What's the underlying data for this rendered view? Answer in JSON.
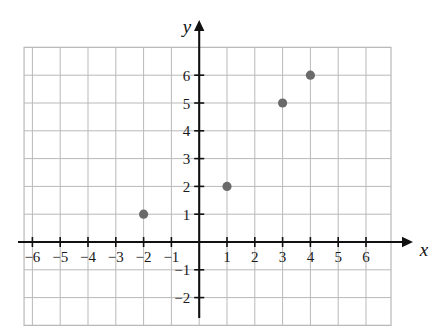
{
  "chart_data": {
    "type": "scatter",
    "title": "",
    "xlabel": "x",
    "ylabel": "y",
    "points": [
      {
        "x": -2,
        "y": 1
      },
      {
        "x": 1,
        "y": 2
      },
      {
        "x": 3,
        "y": 5
      },
      {
        "x": 4,
        "y": 6
      }
    ],
    "x": [
      -2,
      1,
      3,
      4
    ],
    "values": [
      1,
      2,
      5,
      6
    ],
    "xlim": [
      -6.3,
      6.9
    ],
    "ylim": [
      -3.0,
      7.0
    ],
    "x_tick_labels": [
      "−6",
      "−5",
      "−4",
      "−3",
      "−2",
      "−1",
      "1",
      "2",
      "3",
      "4",
      "5",
      "6"
    ],
    "x_tick_values": [
      -6,
      -5,
      -4,
      -3,
      -2,
      -1,
      1,
      2,
      3,
      4,
      5,
      6
    ],
    "y_tick_labels": [
      "6",
      "5",
      "4",
      "3",
      "2",
      "1",
      "−1",
      "−2"
    ],
    "y_tick_values": [
      6,
      5,
      4,
      3,
      2,
      1,
      -1,
      -2
    ],
    "grid": true,
    "grid_step": 1,
    "legend": "none",
    "point_color": "#6a6a6a",
    "axis_color": "#111111",
    "grid_color": "#b9b9b9"
  },
  "axes": {
    "x_label": "x",
    "y_label": "y"
  }
}
